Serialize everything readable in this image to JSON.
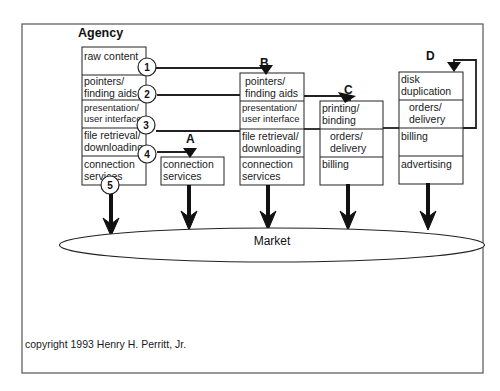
{
  "diagram": {
    "title": "Agency",
    "copyright": "copyright 1993 Henry H. Perritt, Jr.",
    "market_label": "Market",
    "agency_box": {
      "cells": [
        [
          "raw content"
        ],
        [
          "pointers/",
          "finding aids"
        ],
        [
          "presentation/",
          "user interface"
        ],
        [
          "file retrieval/",
          "downloading"
        ],
        [
          "connection",
          "services"
        ]
      ],
      "markers": [
        "1",
        "2",
        "3",
        "4",
        "5"
      ]
    },
    "box_a": {
      "label": "A",
      "cells": [
        [
          "connection",
          "services"
        ]
      ]
    },
    "box_b": {
      "label": "B",
      "cells": [
        [
          "pointers/",
          "finding aids"
        ],
        [
          "presentation/",
          "user interface"
        ],
        [
          "file retrieval/",
          "downloading"
        ],
        [
          "connection",
          "services"
        ]
      ]
    },
    "box_c": {
      "label": "C",
      "cells": [
        [
          "printing/",
          "binding"
        ],
        [
          "orders/",
          "delivery"
        ],
        [
          "billing"
        ]
      ]
    },
    "box_d": {
      "label": "D",
      "cells": [
        [
          "disk",
          "duplication"
        ],
        [
          "orders/",
          "delivery"
        ],
        [
          "billing"
        ],
        [
          "advertising"
        ]
      ]
    },
    "flows": [
      {
        "from": "1",
        "to": "B",
        "desc": "raw content flows to B"
      },
      {
        "from": "2",
        "to": "C",
        "desc": "pointers/finding aids flows to C"
      },
      {
        "from": "3",
        "to": "D",
        "desc": "presentation/user interface flows to D"
      },
      {
        "from": "4",
        "to": "A",
        "desc": "file retrieval/downloading flows to A"
      },
      {
        "from": "5",
        "to": "Market",
        "desc": "connection services flows to Market"
      }
    ],
    "colors": {
      "line": "#222222",
      "background": "#ffffff",
      "text": "#1a1a1a"
    }
  }
}
